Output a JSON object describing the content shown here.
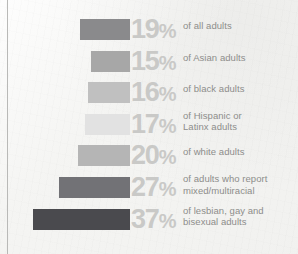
{
  "chart_data": {
    "type": "bar",
    "title": "",
    "subtitle": "",
    "xlabel": "",
    "ylabel": "",
    "orientation": "horizontal",
    "grid": false,
    "legend": "none",
    "xlim": [
      0,
      37
    ],
    "axis_anchor": "right-aligned bars extending leftward",
    "categories": [
      "of all adults",
      "of Asian adults",
      "of black adults",
      "of Hispanic or Latinx adults",
      "of white adults",
      "of adults who report mixed/multiracial",
      "of lesbian, gay and bisexual adults"
    ],
    "values": [
      19,
      15,
      16,
      17,
      20,
      27,
      37
    ],
    "value_labels": [
      "19%",
      "15%",
      "16%",
      "17%",
      "20%",
      "27%",
      "37%"
    ],
    "colors": [
      "#8a8a8c",
      "#a7a7a7",
      "#c0c0c0",
      "#e2e2e2",
      "#b5b5b5",
      "#727276",
      "#4a4a4e"
    ]
  },
  "rows": [
    {
      "number": "19",
      "symbol": "%",
      "label_line1": "of all adults",
      "label_line2": "",
      "value": 19,
      "color": "#8a8a8c"
    },
    {
      "number": "15",
      "symbol": "%",
      "label_line1": "of Asian adults",
      "label_line2": "",
      "value": 15,
      "color": "#a7a7a7"
    },
    {
      "number": "16",
      "symbol": "%",
      "label_line1": "of black adults",
      "label_line2": "",
      "value": 16,
      "color": "#c0c0c0"
    },
    {
      "number": "17",
      "symbol": "%",
      "label_line1": "of Hispanic or",
      "label_line2": "Latinx adults",
      "value": 17,
      "color": "#e2e2e2"
    },
    {
      "number": "20",
      "symbol": "%",
      "label_line1": "of white adults",
      "label_line2": "",
      "value": 20,
      "color": "#b5b5b5"
    },
    {
      "number": "27",
      "symbol": "%",
      "label_line1": "of adults who report",
      "label_line2": "mixed/multiracial",
      "value": 27,
      "color": "#727276"
    },
    {
      "number": "37",
      "symbol": "%",
      "label_line1": "of lesbian, gay and",
      "label_line2": "bisexual adults",
      "value": 37,
      "color": "#4a4a4e"
    }
  ],
  "style": {
    "background": "#f3f3f1",
    "percent_text_color": "#c9c9c7",
    "label_text_color": "#8d8d8b",
    "rule_color": "#b9b9b7"
  }
}
